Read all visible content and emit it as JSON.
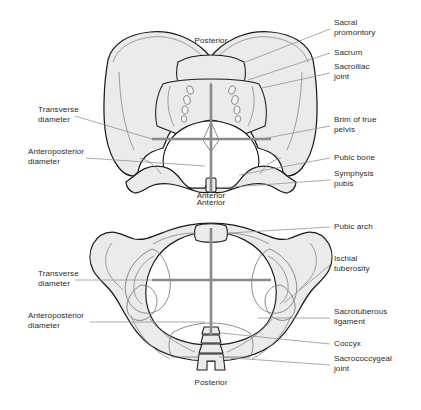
{
  "figure": {
    "background_color": "#ffffff",
    "bone_fill_color": "#ebebeb",
    "bone_outline_color": "#1a1a1a",
    "detail_line_color": "#888888",
    "diameter_line_color": "#8a8a8a",
    "leader_line_color": "#8d8d8d",
    "text_color": "#2b2b2b"
  },
  "top_diagram": {
    "name": "pelvic-inlet-view",
    "orientation_labels": {
      "top": "Posterior",
      "bottom": "Anterior"
    },
    "left_labels": [
      {
        "id": "transverse-diameter",
        "text": "Transverse\ndiameter"
      },
      {
        "id": "anteroposterior-diameter",
        "text": "Anteroposterior\ndiameter"
      }
    ],
    "right_labels": [
      {
        "id": "sacral-promontory",
        "text": "Sacral\npromontory"
      },
      {
        "id": "sacrum",
        "text": "Sacrum"
      },
      {
        "id": "sacroiliac-joint",
        "text": "Sacroiliac\njoint"
      },
      {
        "id": "brim-of-true-pelvis",
        "text": "Brim of true\npelvis"
      },
      {
        "id": "pubic-bone",
        "text": "Pubic bone"
      },
      {
        "id": "symphysis-pubis",
        "text": "Symphysis\npubis"
      }
    ]
  },
  "bottom_diagram": {
    "name": "pelvic-outlet-view",
    "orientation_labels": {
      "top": "Anterior",
      "bottom": "Posterior"
    },
    "left_labels": [
      {
        "id": "transverse-diameter",
        "text": "Transverse\ndiameter"
      },
      {
        "id": "anteroposterior-diameter",
        "text": "Anteroposterior\ndiameter"
      }
    ],
    "right_labels": [
      {
        "id": "pubic-arch",
        "text": "Pubic arch"
      },
      {
        "id": "ischial-tuberosity",
        "text": "Ischial\ntuberosity"
      },
      {
        "id": "sacrotuberous-ligament",
        "text": "Sacrotuberous\nligament"
      },
      {
        "id": "coccyx",
        "text": "Coccyx"
      },
      {
        "id": "sacrococcygeal-joint",
        "text": "Sacrococcygeal\njoint"
      }
    ]
  }
}
